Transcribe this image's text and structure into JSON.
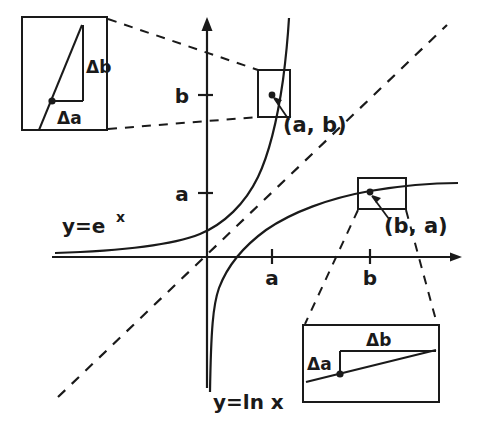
{
  "figure": {
    "width": 479,
    "height": 429,
    "background": "#ffffff",
    "ink": "#1a1a1a"
  },
  "axes": {
    "x_axis_label": "",
    "y_axis_label": "",
    "origin": {
      "x": 207,
      "y": 257
    },
    "x_ticks": [
      {
        "label": "a",
        "x": 272
      },
      {
        "label": "b",
        "x": 370
      }
    ],
    "y_ticks": [
      {
        "label": "b",
        "y": 95
      },
      {
        "label": "a",
        "y": 193
      }
    ]
  },
  "curves": {
    "exponential": {
      "label": "y=e",
      "exponent": "x",
      "label_x": 62,
      "label_y": 228
    },
    "logarithm": {
      "label": "y=ln x",
      "label_x": 213,
      "label_y": 404
    },
    "identity": {
      "label": "",
      "style": "dashed"
    }
  },
  "points": [
    {
      "name": "point-ab",
      "label": "(a, b)",
      "px": 272,
      "py": 95,
      "label_x": 283,
      "label_y": 130
    },
    {
      "name": "point-ba",
      "label": "(b, a)",
      "px": 370,
      "py": 193,
      "label_x": 384,
      "label_y": 231
    }
  ],
  "insets": [
    {
      "name": "inset-top-left",
      "source_point": "(a, b)",
      "box": {
        "x": 22,
        "y": 17,
        "w": 85,
        "h": 113
      },
      "delta_x_label": "Δa",
      "delta_y_label": "Δb",
      "delta_x_label_pos": {
        "x": 61,
        "y": 120
      },
      "delta_y_label_pos": {
        "x": 78,
        "y": 72
      },
      "note": "steep slope: small Δa gives large Δb"
    },
    {
      "name": "inset-bottom-right",
      "source_point": "(b, a)",
      "box": {
        "x": 303,
        "y": 325,
        "w": 136,
        "h": 77
      },
      "delta_x_label": "Δa",
      "delta_y_label": "Δb",
      "delta_x_label_pos": {
        "x": 310,
        "y": 364
      },
      "delta_y_label_pos": {
        "x": 372,
        "y": 345
      },
      "note": "shallow slope: large Δb gives small Δa"
    }
  ],
  "magnify_boxes": [
    {
      "name": "magnify-box-ab",
      "x": 258,
      "y": 70,
      "w": 32,
      "h": 47
    },
    {
      "name": "magnify-box-ba",
      "x": 358,
      "y": 178,
      "w": 48,
      "h": 31
    }
  ]
}
